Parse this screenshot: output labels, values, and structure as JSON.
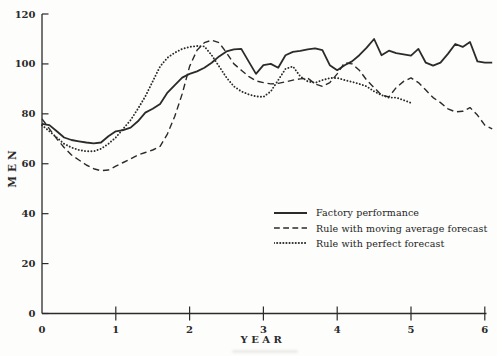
{
  "chart_data": {
    "type": "line",
    "title": "",
    "xlabel": "YEAR",
    "ylabel": "MEN",
    "xlim": [
      0,
      6
    ],
    "ylim": [
      0,
      120
    ],
    "x_ticks": [
      0,
      1,
      2,
      3,
      4,
      5,
      6
    ],
    "y_ticks": [
      0,
      20,
      40,
      60,
      80,
      100,
      120
    ],
    "grid": false,
    "legend_position": "lower-right-inside",
    "x_step": 0.1,
    "series": [
      {
        "name": "Factory performance",
        "style": "solid",
        "x_start": 0,
        "values": [
          76,
          75.5,
          73,
          70.5,
          69.5,
          69,
          68.5,
          68.2,
          68.5,
          71,
          73,
          73.5,
          74.5,
          77,
          80.5,
          82,
          84,
          88.5,
          91.5,
          94.5,
          96,
          97,
          98.5,
          100.5,
          103,
          105,
          105.8,
          106,
          101,
          96,
          99.5,
          100,
          98.5,
          103.5,
          104.8,
          105.2,
          105.8,
          106.2,
          105.5,
          99.5,
          97.5,
          99.5,
          101,
          103.5,
          106.5,
          110,
          103.5,
          105.3,
          104.3,
          103.8,
          103.3,
          106,
          100.5,
          99.3,
          100.5,
          104,
          108,
          106.8,
          108.8,
          101,
          100.5,
          100.5
        ]
      },
      {
        "name": "Rule with moving average forecast",
        "style": "dashed",
        "x_start": 0,
        "values": [
          78,
          74,
          70,
          66.5,
          63.5,
          61.5,
          59.5,
          58,
          57.2,
          57.5,
          59,
          60.5,
          62,
          63.5,
          64.5,
          65.5,
          67,
          72,
          79,
          88,
          99,
          105.5,
          108.5,
          109.5,
          108.5,
          104.5,
          100,
          97.5,
          95,
          93.2,
          92.5,
          92,
          92.2,
          92.8,
          93.5,
          94,
          94.3,
          92,
          91,
          92.5,
          96,
          100.5,
          100,
          97.5,
          93.5,
          90.5,
          87.5,
          86.8,
          90.5,
          93,
          94.4,
          92.5,
          89.5,
          86.5,
          84.5,
          82,
          80.8,
          81,
          82.5,
          79.5,
          75.5,
          74
        ]
      },
      {
        "name": "Rule with perfect forecast",
        "style": "dotted",
        "x_start": 0,
        "values": [
          75.5,
          73,
          70.5,
          68,
          66.5,
          65.5,
          65,
          65,
          66,
          68,
          70.5,
          74,
          77.5,
          82,
          87,
          93,
          99,
          102.5,
          104.5,
          106,
          106.8,
          107.2,
          107,
          103.5,
          99,
          94.5,
          91,
          89,
          87.8,
          87,
          86.8,
          89,
          93.5,
          98,
          99,
          95,
          93,
          92.4,
          93.5,
          94.3,
          94.4,
          93.5,
          92.8,
          92,
          91,
          89,
          87.5,
          86.5,
          86.5,
          85.5,
          84.4
        ]
      }
    ]
  }
}
